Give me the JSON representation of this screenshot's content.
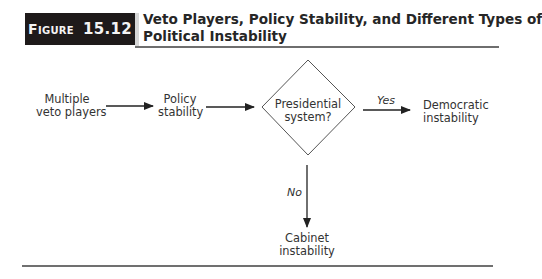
{
  "figure": {
    "label_word": "Figure",
    "label_number": "15.12",
    "title_line1": "Veto Players, Policy Stability, and Different Types of",
    "title_line2": "Political Instability"
  },
  "nodes": {
    "multiple_veto_players": {
      "line1": "Multiple",
      "line2": "veto players"
    },
    "policy_stability": {
      "line1": "Policy",
      "line2": "stability"
    },
    "presidential_system": {
      "line1": "Presidential",
      "line2": "system?"
    },
    "democratic_instability": {
      "line1": "Democratic",
      "line2": "instability"
    },
    "cabinet_instability": {
      "line1": "Cabinet",
      "line2": "instability"
    }
  },
  "edges": {
    "yes_label": "Yes",
    "no_label": "No"
  },
  "colors": {
    "figure_box": "#1e1a1a",
    "figure_text": "#f4f4f4",
    "lines": "#2a2a2a",
    "rules": "#6e6e6e"
  }
}
